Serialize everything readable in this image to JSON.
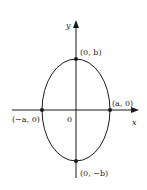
{
  "diagram": {
    "type": "ellipse-on-axes",
    "axes": {
      "x_label": "x",
      "y_label": "y",
      "origin_label": "0"
    },
    "points": [
      {
        "id": "top",
        "label": "(0, b)"
      },
      {
        "id": "bottom",
        "label": "(0, −b)"
      },
      {
        "id": "left",
        "label": "(−a, 0)"
      },
      {
        "id": "right",
        "label": "(a, 0)"
      }
    ],
    "colors": {
      "stroke": "#1a1a1a",
      "background": "#ffffff"
    }
  }
}
